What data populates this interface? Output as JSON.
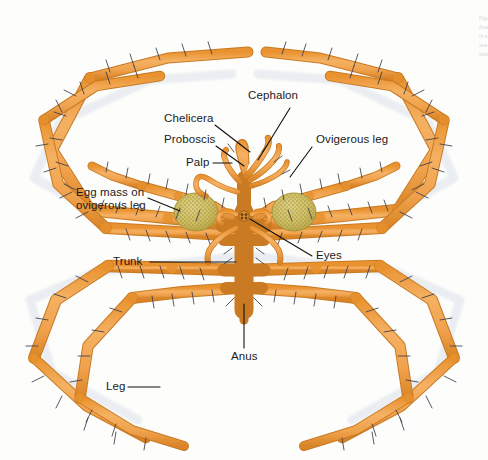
{
  "figure": {
    "background_color": "#fdfdfb",
    "body_color": "#F2A64E",
    "body_shade_color": "#E08C2E",
    "body_outline_color": "#C97A22",
    "egg_mass_color": "#CFC06A",
    "egg_mass_speckle_color": "#A99531",
    "seta_color": "#3a3a4a",
    "leader_line_color": "#111111",
    "label_text_color": "#1b1b1b"
  },
  "labels": [
    {
      "id": "cephalon",
      "text": "Cephalon",
      "x": 248,
      "y": 96
    },
    {
      "id": "chelicera",
      "text": "Chelicera",
      "x": 164,
      "y": 119
    },
    {
      "id": "proboscis",
      "text": "Proboscis",
      "x": 164,
      "y": 140
    },
    {
      "id": "palp",
      "text": "Palp",
      "x": 192,
      "y": 160
    },
    {
      "id": "ovigerous-leg",
      "text": "Ovigerous leg",
      "x": 314,
      "y": 140
    },
    {
      "id": "egg-mass",
      "text": "Egg mass on ovigerous leg",
      "x": 80,
      "y": 188
    },
    {
      "id": "trunk",
      "text": "Trunk",
      "x": 113,
      "y": 258
    },
    {
      "id": "eyes",
      "text": "Eyes",
      "x": 314,
      "y": 252
    },
    {
      "id": "anus",
      "text": "Anus",
      "x": 233,
      "y": 350
    },
    {
      "id": "leg",
      "text": "Leg",
      "x": 108,
      "y": 383
    }
  ],
  "edge_text": {
    "lines": [
      "Figure",
      "Anatomy",
      "of a",
      "sea",
      "spider"
    ]
  }
}
